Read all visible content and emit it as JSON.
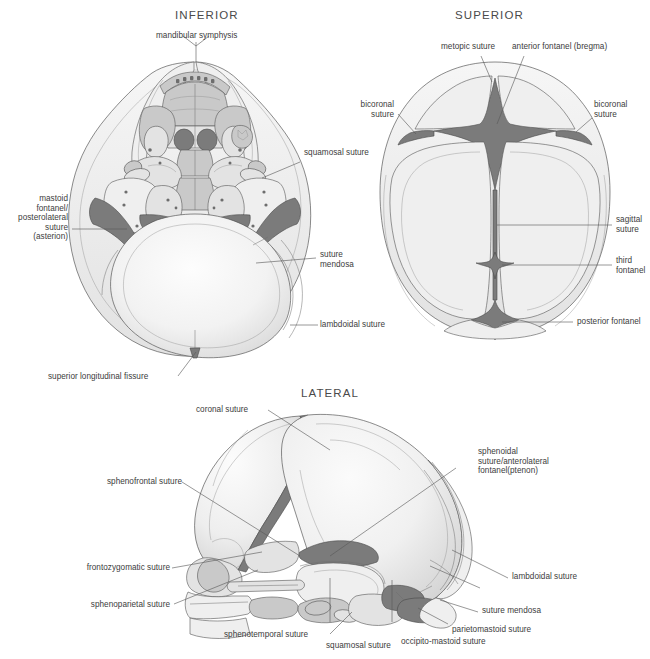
{
  "figure": {
    "background_color": "#ffffff",
    "text_color": "#3c3c3c",
    "fontanel_fill_color": "#7b7b7b"
  },
  "views": [
    {
      "id": "inferior",
      "title": "INFERIOR",
      "labels": [
        {
          "id": "mandibular-symphysis",
          "text": "mandibular symphysis"
        },
        {
          "id": "squamosal-suture",
          "text": "squamosal suture"
        },
        {
          "id": "mastoid-fontanel",
          "text": "mastoid\nfontanel/\nposterolateral\nsuture\n(asterion)"
        },
        {
          "id": "suture-mendosa",
          "text": "suture\nmendosa"
        },
        {
          "id": "lambdoidal-suture",
          "text": "lambdoidal suture"
        },
        {
          "id": "superior-longitudinal-fissure",
          "text": "superior longitudinal fissure"
        }
      ]
    },
    {
      "id": "superior",
      "title": "SUPERIOR",
      "labels": [
        {
          "id": "metopic-suture",
          "text": "metopic suture"
        },
        {
          "id": "anterior-fontanel",
          "text": "anterior fontanel (bregma)"
        },
        {
          "id": "bicoronal-suture-left",
          "text": "bicoronal\nsuture"
        },
        {
          "id": "bicoronal-suture-right",
          "text": "bicoronal\nsuture"
        },
        {
          "id": "sagittal-suture",
          "text": "sagittal\nsuture"
        },
        {
          "id": "third-fontanel",
          "text": "third\nfontanel"
        },
        {
          "id": "posterior-fontanel",
          "text": "posterior fontanel"
        }
      ]
    },
    {
      "id": "lateral",
      "title": "LATERAL",
      "labels": [
        {
          "id": "coronal-suture",
          "text": "coronal suture"
        },
        {
          "id": "sphenoidal-suture",
          "text": "sphenoidal\nsuture/anterolateral\nfontanel(ptenon)"
        },
        {
          "id": "sphenofrontal-suture",
          "text": "sphenofrontal suture"
        },
        {
          "id": "frontozygomatic-suture",
          "text": "frontozygomatic suture"
        },
        {
          "id": "sphenoparietal-suture",
          "text": "sphenoparietal suture"
        },
        {
          "id": "sphenotemporal-suture",
          "text": "sphenotemporal suture"
        },
        {
          "id": "squamosal-suture-lateral",
          "text": "squamosal suture"
        },
        {
          "id": "occipito-mastoid-suture",
          "text": "occipito-mastoid suture"
        },
        {
          "id": "parietomastoid-suture",
          "text": "parietomastoid suture"
        },
        {
          "id": "suture-mendosa-lateral",
          "text": "suture mendosa"
        },
        {
          "id": "lambdoidal-suture-lateral",
          "text": "lambdoidal suture"
        }
      ]
    }
  ]
}
